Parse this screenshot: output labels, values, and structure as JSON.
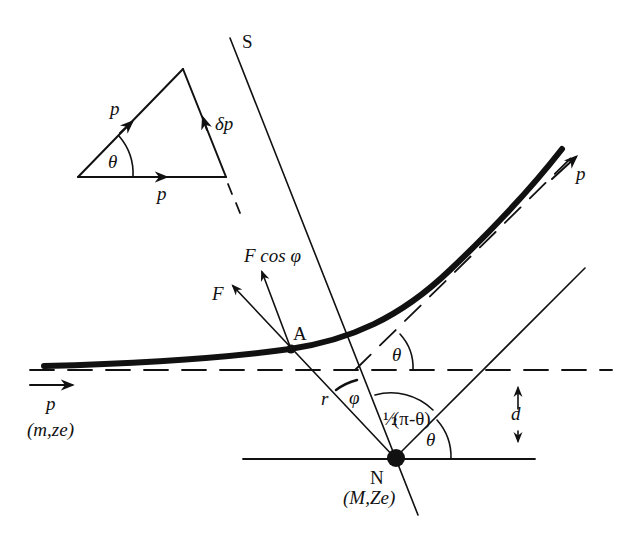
{
  "figure": {
    "colors": {
      "ink": "#111111",
      "background": "#ffffff"
    },
    "labels": {
      "axis_s": "S",
      "triangle_p_incline": "p",
      "triangle_p_base": "p",
      "triangle_delta_p": "δp",
      "triangle_theta": "θ",
      "force_f": "F",
      "force_f_cos_phi": "F cos φ",
      "point_a": "A",
      "outgoing_p": "p",
      "exit_theta": "θ",
      "incoming_p": "p",
      "incoming_particle": "(m,ze)",
      "radius_r": "r",
      "angle_phi": "φ",
      "half_angle_prefix": "½",
      "half_angle": "(π-θ)",
      "nucleus_theta": "θ",
      "impact_parameter_d": "d",
      "nucleus_n": "N",
      "nucleus_props": "(M,Ze)"
    },
    "icons": {
      "trajectory": "thick-curve",
      "nucleus": "filled-circle",
      "point-a": "small-filled-circle",
      "vector-arrow": "arrowhead",
      "dimension": "double-arrow"
    }
  }
}
